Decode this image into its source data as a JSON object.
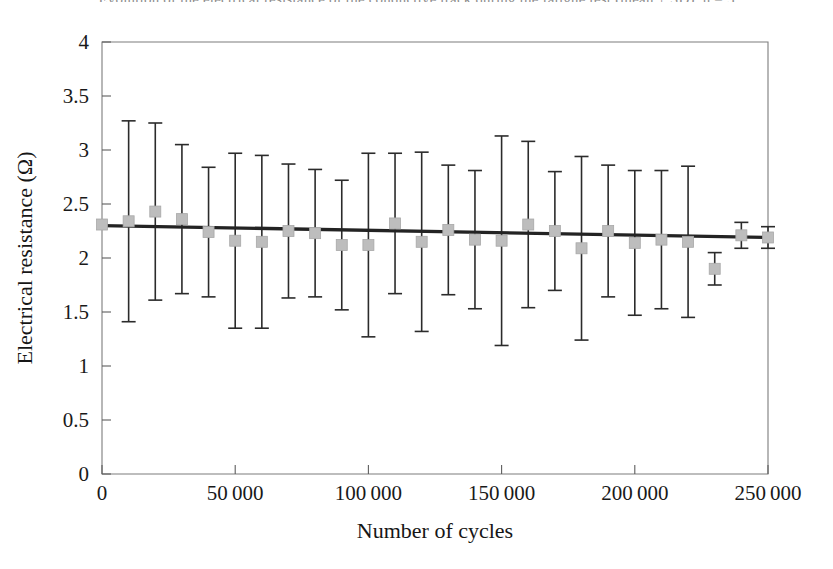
{
  "figure": {
    "cut_off_title": "Evolution of the electrical resistance of the conductive track during the fatigue test (mean ± SD), n = 5",
    "background_color": "#ffffff"
  },
  "chart_data": {
    "type": "scatter",
    "title": "",
    "xlabel": "Number of cycles",
    "ylabel": "Electrical resistance (Ω)",
    "xlim": [
      0,
      250000
    ],
    "ylim": [
      0,
      4
    ],
    "xticks": [
      0,
      50000,
      100000,
      150000,
      200000,
      250000
    ],
    "xtick_labels": [
      "0",
      "50 000",
      "100 000",
      "150 000",
      "200 000",
      "250 000"
    ],
    "yticks": [
      0,
      0.5,
      1,
      1.5,
      2,
      2.5,
      3,
      3.5,
      4
    ],
    "ytick_labels": [
      "0",
      "0.5",
      "1",
      "1.5",
      "2",
      "2.5",
      "3",
      "3.5",
      "4"
    ],
    "grid": false,
    "legend": false,
    "marker_style": "square",
    "marker_color": "#bdbdbd",
    "errorbar_color": "#2b2b2b",
    "trendline_color": "#232323",
    "x": [
      0,
      10000,
      20000,
      30000,
      40000,
      50000,
      60000,
      70000,
      80000,
      90000,
      100000,
      110000,
      120000,
      130000,
      140000,
      150000,
      160000,
      170000,
      180000,
      190000,
      200000,
      210000,
      220000,
      230000,
      240000,
      250000
    ],
    "y": [
      2.31,
      2.34,
      2.43,
      2.36,
      2.24,
      2.16,
      2.15,
      2.25,
      2.23,
      2.12,
      2.12,
      2.32,
      2.15,
      2.26,
      2.17,
      2.16,
      2.31,
      2.25,
      2.09,
      2.25,
      2.14,
      2.17,
      2.15,
      1.9,
      2.21,
      2.19
    ],
    "yerr": [
      0.0,
      0.93,
      0.82,
      0.69,
      0.6,
      0.81,
      0.8,
      0.62,
      0.59,
      0.6,
      0.85,
      0.65,
      0.83,
      0.6,
      0.64,
      0.97,
      0.77,
      0.55,
      0.85,
      0.61,
      0.67,
      0.64,
      0.7,
      0.15,
      0.12,
      0.1
    ],
    "trendline": {
      "x": [
        0,
        250000
      ],
      "y": [
        2.3,
        2.19
      ],
      "equation_visible": false
    }
  }
}
